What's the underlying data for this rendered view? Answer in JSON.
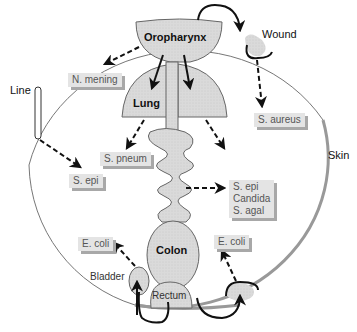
{
  "diagram": {
    "boundary_label": "Skin",
    "organs": {
      "oropharynx": "Oropharynx",
      "lung": "Lung",
      "colon": "Colon",
      "rectum": "Rectum",
      "bladder": "Bladder"
    },
    "external": {
      "wound": "Wound",
      "line": "Line"
    },
    "organisms": {
      "n_mening": "N. mening",
      "s_pneum": "S. pneum",
      "s_aureus": "S. aureus",
      "s_epi_line": "S. epi",
      "gut_list": [
        "S. epi",
        "Candida",
        "S. agal"
      ],
      "e_coli_bladder": "E. coli",
      "e_coli_skin": "E. coli"
    },
    "colors": {
      "organ_fill": "#d9d9d9",
      "box_fill": "#e4e4e4",
      "box_shadow": "#a8a8a8",
      "skin_line": "#8a8a8a",
      "arrow": "#111111"
    }
  }
}
